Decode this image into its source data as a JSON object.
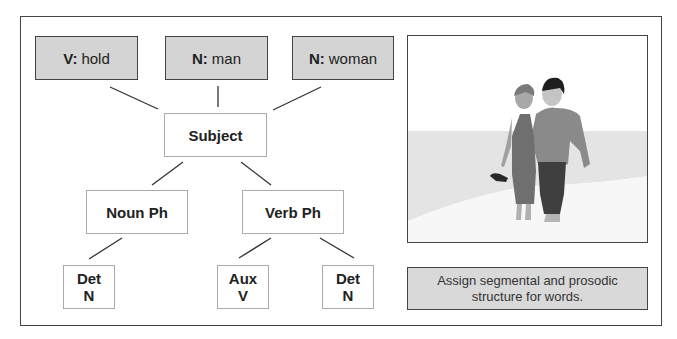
{
  "diagram": {
    "words": [
      {
        "category": "V:",
        "word": "hold"
      },
      {
        "category": "N:",
        "word": "man"
      },
      {
        "category": "N:",
        "word": "woman"
      }
    ],
    "nodes": {
      "subject": "Subject",
      "noun_phrase": "Noun Ph",
      "verb_phrase": "Verb Ph",
      "leaves": [
        {
          "line1": "Det",
          "line2": "N"
        },
        {
          "line1": "Aux",
          "line2": "V"
        },
        {
          "line1": "Det",
          "line2": "N"
        }
      ]
    }
  },
  "photo": {
    "description": "Couple walking barefoot on a beach"
  },
  "caption": {
    "text": "Assign segmental and prosodic structure for words."
  },
  "colors": {
    "word_box_fill": "#d4d4d4",
    "caption_fill": "#d9d9d9",
    "border": "#444444"
  }
}
